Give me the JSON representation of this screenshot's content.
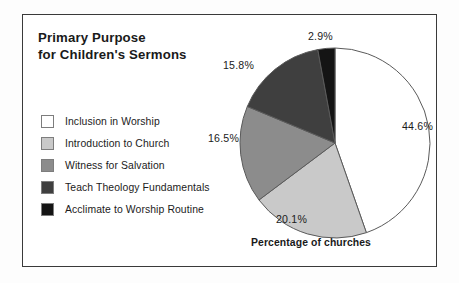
{
  "figure": {
    "title_line1": "Primary Purpose",
    "title_line2": "for Children's Sermons",
    "caption": "Percentage of churches",
    "frame_color": "#3a3a3a",
    "background": "#ffffff"
  },
  "legend": {
    "items": [
      {
        "label": "Inclusion in Worship",
        "color": "#ffffff"
      },
      {
        "label": "Introduction to Church",
        "color": "#c9c9c9"
      },
      {
        "label": "Witness for Salvation",
        "color": "#8c8c8c"
      },
      {
        "label": "Teach Theology Fundamentals",
        "color": "#3f3f3f"
      },
      {
        "label": "Acclimate to Worship Routine",
        "color": "#141414"
      }
    ]
  },
  "labels": {
    "slice1": "44.6%",
    "slice2": "20.1%",
    "slice3": "16.5%",
    "slice4": "15.8%",
    "slice5": "2.9%"
  },
  "chart_data": {
    "type": "pie",
    "title": "Primary Purpose for Children's Sermons",
    "xlabel": "Percentage of churches",
    "ylabel": "",
    "units": "percent",
    "start_angle_deg": 0,
    "direction": "clockwise",
    "legend_position": "left",
    "grid": false,
    "categories": [
      "Inclusion in Worship",
      "Introduction to Church",
      "Witness for Salvation",
      "Teach Theology Fundamentals",
      "Acclimate to Worship Routine"
    ],
    "values": [
      44.6,
      20.1,
      16.5,
      15.8,
      2.9
    ],
    "value_labels": [
      "44.6%",
      "20.1%",
      "16.5%",
      "15.8%",
      "2.9%"
    ],
    "colors": [
      "#ffffff",
      "#c9c9c9",
      "#8c8c8c",
      "#3f3f3f",
      "#141414"
    ],
    "slice_edge_color": "#5a5a5a",
    "total": 99.9
  }
}
